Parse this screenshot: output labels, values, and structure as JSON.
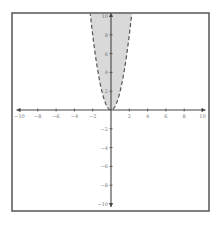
{
  "chart_data": {
    "type": "area",
    "title": "",
    "xlabel": "",
    "ylabel": "",
    "xlim": [
      -10,
      10
    ],
    "ylim": [
      -10,
      10
    ],
    "grid": false,
    "legend": null,
    "x_ticks": [
      -10,
      -8,
      -6,
      -4,
      -2,
      2,
      4,
      6,
      8,
      10
    ],
    "x_tick_labels": [
      "−10",
      "−8",
      "−6",
      "−4",
      "−2",
      "2",
      "4",
      "6",
      "8",
      "10"
    ],
    "y_ticks": [
      10,
      8,
      6,
      4,
      2,
      -2,
      -4,
      -6,
      -8,
      -10
    ],
    "y_tick_labels": [
      "10",
      "8",
      "6",
      "4",
      "2",
      "−2",
      "−4",
      "−6",
      "−8",
      "−10"
    ],
    "series": [
      {
        "name": "boundary y = 2x^2",
        "style": "dashed",
        "shaded_region": "y > 2x^2",
        "x": [
          -2.24,
          -2,
          -1.5,
          -1,
          -0.5,
          0,
          0.5,
          1,
          1.5,
          2,
          2.24
        ],
        "y": [
          10,
          8,
          4.5,
          2,
          0.5,
          0,
          0.5,
          2,
          4.5,
          8,
          10
        ]
      }
    ]
  },
  "colors": {
    "frame": "#555555",
    "axis": "#444444",
    "curve": "#555555",
    "shade": "#d9d9d9",
    "tick_label": "#777777"
  }
}
